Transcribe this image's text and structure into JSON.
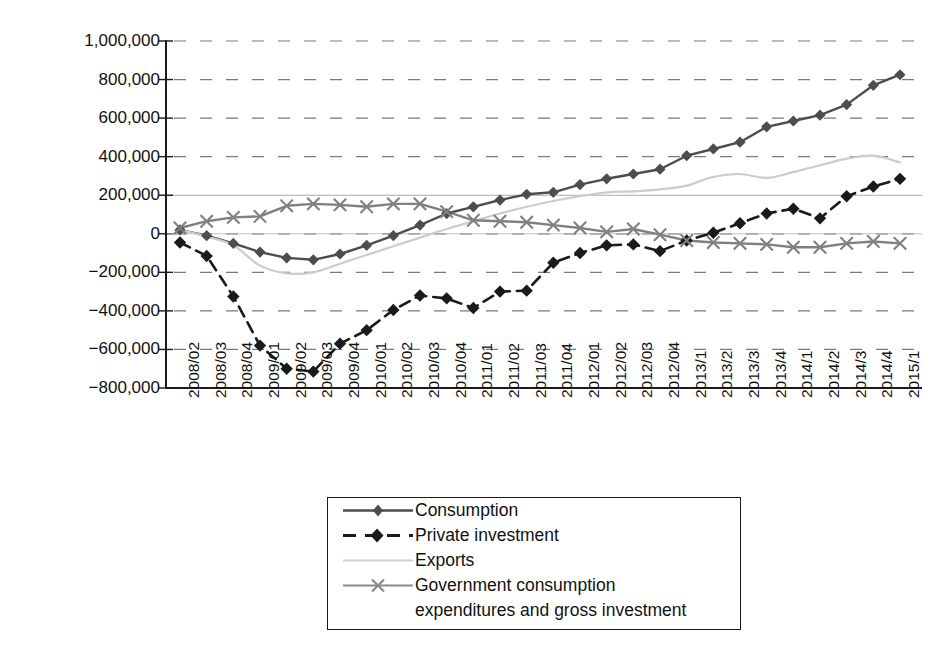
{
  "chart_data": {
    "type": "line",
    "title": "",
    "xlabel": "",
    "ylabel": "Million chained (2009) dollars",
    "ylim": [
      -800000,
      1000000
    ],
    "ytick_step": 200000,
    "ytick_labels": [
      "1,000,000",
      "800,000",
      "600,000",
      "400,000",
      "200,000",
      "0",
      "−200,000",
      "−400,000",
      "−600,000",
      "−800,000"
    ],
    "ytick_values": [
      1000000,
      800000,
      600000,
      400000,
      200000,
      0,
      -200000,
      -400000,
      -600000,
      -800000
    ],
    "grid": "horizontal-dashed",
    "legend_position": "below-center",
    "categories": [
      "2008/02",
      "2008/03",
      "2008/04",
      "2009/01",
      "2009/02",
      "2009/03",
      "2009/04",
      "2010/01",
      "2010/02",
      "2010/03",
      "2010/04",
      "2011/01",
      "2011/02",
      "2011/03",
      "2011/04",
      "2012/01",
      "2012/02",
      "2012/03",
      "2012/04",
      "2013/1",
      "2013/2",
      "2013/3",
      "2013/4",
      "2014/1",
      "2014/2",
      "2014/3",
      "2014/4",
      "2015/1"
    ],
    "series": [
      {
        "name": "Consumption",
        "color": "#4d4d4d",
        "marker": "diamond",
        "dash": "solid",
        "values": [
          20000,
          -10000,
          -50000,
          -95000,
          -125000,
          -135000,
          -105000,
          -60000,
          -10000,
          45000,
          105000,
          140000,
          175000,
          205000,
          215000,
          255000,
          285000,
          310000,
          335000,
          405000,
          440000,
          475000,
          555000,
          585000,
          615000,
          670000,
          770000,
          825000
        ]
      },
      {
        "name": "Private investment",
        "color": "#1a1a1a",
        "marker": "diamond",
        "dash": "dashed",
        "values": [
          -45000,
          -115000,
          -325000,
          -580000,
          -700000,
          -715000,
          -570000,
          -500000,
          -395000,
          -320000,
          -335000,
          -385000,
          -300000,
          -295000,
          -150000,
          -100000,
          -60000,
          -55000,
          -90000,
          -35000,
          5000,
          55000,
          105000,
          130000,
          80000,
          195000,
          245000,
          285000
        ]
      },
      {
        "name": "Exports",
        "color": "#cccccc",
        "marker": "none",
        "dash": "solid",
        "values": [
          20000,
          -15000,
          -60000,
          -165000,
          -205000,
          -200000,
          -155000,
          -110000,
          -65000,
          -20000,
          25000,
          65000,
          105000,
          140000,
          170000,
          195000,
          215000,
          220000,
          230000,
          250000,
          295000,
          310000,
          290000,
          320000,
          355000,
          390000,
          405000,
          370000
        ]
      },
      {
        "name": "Government consumption expenditures and gross investment",
        "color": "#808080",
        "marker": "x",
        "dash": "solid",
        "values": [
          30000,
          65000,
          85000,
          90000,
          145000,
          155000,
          150000,
          140000,
          155000,
          155000,
          115000,
          70000,
          65000,
          60000,
          45000,
          30000,
          10000,
          25000,
          -5000,
          -35000,
          -45000,
          -50000,
          -55000,
          -70000,
          -70000,
          -50000,
          -40000,
          -50000
        ]
      }
    ],
    "legend": [
      {
        "label": "Consumption",
        "key": "consumption"
      },
      {
        "label": "Private investment",
        "key": "private-investment"
      },
      {
        "label": "Exports",
        "key": "exports"
      },
      {
        "label": "Government consumption",
        "key": "government-consumption"
      },
      {
        "label": "expenditures and gross investment",
        "key": "government-consumption-line2"
      }
    ]
  }
}
